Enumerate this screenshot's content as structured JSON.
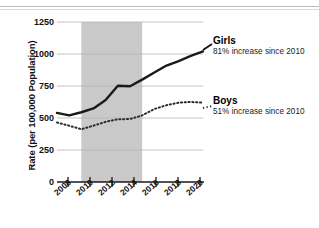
{
  "chart_data": {
    "type": "line",
    "title": "",
    "xlabel": "",
    "ylabel": "Rate (per 100,000 Population)",
    "xlim": [
      2008,
      2020
    ],
    "ylim": [
      0,
      1250
    ],
    "yticks": [
      0,
      250,
      500,
      750,
      1000,
      1250
    ],
    "ytick_labels": [
      "0",
      "250",
      "500",
      "750",
      "1000",
      "1250"
    ],
    "xticks": [
      2008,
      2010,
      2012,
      2014,
      2016,
      2018,
      2020
    ],
    "xtick_labels": [
      "2008",
      "2010",
      "2012",
      "2014",
      "2016",
      "2018",
      "2020"
    ],
    "grid": "horizontal",
    "legend_position": "right-inline",
    "x": [
      2008,
      2009,
      2010,
      2011,
      2012,
      2013,
      2014,
      2015,
      2016,
      2017,
      2018,
      2019,
      2020
    ],
    "series": [
      {
        "name": "Girls",
        "style": "solid",
        "color": "#1a1a1a",
        "values": [
          540,
          520,
          545,
          575,
          640,
          752,
          748,
          800,
          855,
          910,
          945,
          985,
          1020
        ]
      },
      {
        "name": "Boys",
        "style": "dotted",
        "color": "#2b2b2b",
        "values": [
          465,
          440,
          412,
          440,
          470,
          490,
          492,
          520,
          570,
          600,
          620,
          625,
          620
        ]
      }
    ],
    "shaded_band": {
      "x_start": 2010,
      "x_end": 2015,
      "color": "#c9c9c9"
    },
    "annotations": [
      {
        "series": "Girls",
        "title": "Girls",
        "note": "81% increase since 2010"
      },
      {
        "series": "Boys",
        "title": "Boys",
        "note": "51% increase since 2010"
      }
    ]
  },
  "axes": {
    "y_axis_label": "Rate (per 100,000 Population)",
    "y_tick_labels": [
      "1250",
      "1000",
      "750",
      "500",
      "250",
      "0"
    ],
    "x_tick_labels": [
      "2008",
      "2010",
      "2012",
      "2014",
      "2016",
      "2018",
      "2020"
    ]
  },
  "legend": {
    "girls_title": "Girls",
    "girls_note": "81% increase since 2010",
    "boys_title": "Boys",
    "boys_note": "51% increase since 2010"
  },
  "colors": {
    "band": "#c9c9c9",
    "grid": "#b5b5b5",
    "axis": "#1a1a1a",
    "girls_line": "#1a1a1a",
    "boys_line": "#2b2b2b",
    "text": "#111111"
  }
}
